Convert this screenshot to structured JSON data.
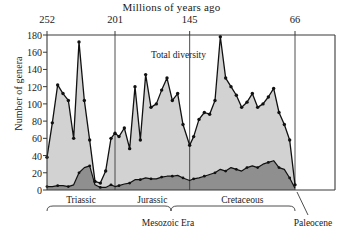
{
  "chart_data": {
    "type": "area",
    "title": "Millions of years ago",
    "xlabel": "Millions of years ago",
    "ylabel": "Number of genera",
    "xlim": [
      252,
      60
    ],
    "ylim": [
      0,
      180
    ],
    "x_ticks": [
      252,
      201,
      145,
      66
    ],
    "y_ticks": [
      0,
      20,
      40,
      60,
      80,
      100,
      120,
      140,
      160,
      180
    ],
    "grid": false,
    "legend_position": "in-plot annotations",
    "axis_direction": "reversed (oldest at left)",
    "annotations": [
      {
        "text": "Total diversity",
        "series": "total_diversity"
      },
      {
        "text": "New genera",
        "series": "new_genera"
      },
      {
        "text": "Holdover genera",
        "series": "holdover_genera"
      }
    ],
    "x": [
      252,
      248,
      244,
      240,
      236,
      232,
      228,
      224,
      220,
      216,
      212,
      208,
      204,
      201,
      198,
      194,
      190,
      186,
      182,
      178,
      174,
      170,
      166,
      162,
      158,
      154,
      150,
      145,
      142,
      138,
      134,
      130,
      126,
      122,
      118,
      114,
      110,
      106,
      102,
      98,
      94,
      90,
      86,
      82,
      78,
      74,
      70,
      66
    ],
    "series": [
      {
        "name": "Total diversity",
        "key": "total_diversity",
        "values": [
          38,
          78,
          122,
          112,
          104,
          60,
          172,
          104,
          58,
          10,
          8,
          22,
          60,
          66,
          62,
          72,
          48,
          120,
          58,
          134,
          96,
          100,
          116,
          130,
          104,
          112,
          76,
          52,
          62,
          82,
          90,
          88,
          104,
          178,
          130,
          120,
          110,
          96,
          102,
          112,
          96,
          100,
          108,
          118,
          90,
          76,
          58,
          6
        ]
      },
      {
        "name": "New genera",
        "key": "new_genera",
        "note": "region between holdover curve and total-diversity curve"
      },
      {
        "name": "Holdover genera",
        "key": "holdover_genera",
        "values": [
          4,
          4,
          5,
          5,
          4,
          6,
          20,
          26,
          28,
          6,
          3,
          3,
          6,
          4,
          5,
          7,
          8,
          12,
          12,
          14,
          13,
          13,
          15,
          16,
          16,
          17,
          14,
          11,
          13,
          14,
          16,
          18,
          20,
          24,
          22,
          26,
          24,
          22,
          26,
          28,
          26,
          30,
          32,
          34,
          26,
          24,
          14,
          2
        ]
      }
    ],
    "periods": [
      {
        "label": "Triassic",
        "start": 252,
        "end": 201
      },
      {
        "label": "Jurassic",
        "start": 201,
        "end": 145
      },
      {
        "label": "Cretaceous",
        "start": 145,
        "end": 66
      },
      {
        "label": "Paleocene",
        "start": 66,
        "end": 60
      }
    ],
    "era": {
      "label": "Mesozoic Era",
      "start": 252,
      "end": 66
    },
    "colors": {
      "new_genera_fill": "#d2d2d2",
      "holdover_genera_fill": "#8f8f8f",
      "line": "#111111",
      "axis": "#3a3a3a",
      "background": "#ffffff"
    }
  }
}
